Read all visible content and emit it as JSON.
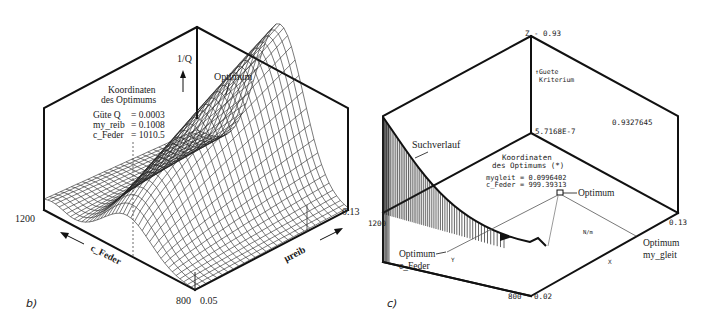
{
  "figure": {
    "panels": [
      {
        "id": "b",
        "label": "b)",
        "type": "3d-surface",
        "z_axis_label": "1/Q",
        "optimum_label": "Optimum",
        "info_box": {
          "title_line1": "Koordinaten",
          "title_line2": "des Optimums",
          "rows": [
            {
              "name": "Güte Q",
              "value": "= 0.0003"
            },
            {
              "name": "my_reib",
              "value": "= 0.1008"
            },
            {
              "name": "c_Feder",
              "value": "= 1010.5"
            }
          ]
        },
        "axes": {
          "x_label": "c_Feder",
          "y_label": "μreib",
          "x_tick_far": "1200",
          "x_tick_near": "800",
          "y_tick_near": "0.05",
          "y_tick_far": "0.13"
        }
      },
      {
        "id": "c",
        "label": "c)",
        "type": "3d-search-path",
        "z_top": "Z - 0.93",
        "z_axis_label_line1": "↑Guete",
        "z_axis_label_line2": "Kriterium",
        "z_min_value": "5.7168E-7",
        "z_right_value": "0.9327645",
        "path_label": "Suchverlauf",
        "info_box": {
          "title_line1": "Koordinaten",
          "title_line2": "des Optimums (*)",
          "rows": [
            {
              "name": "mygleit",
              "value": "= 0.0996402"
            },
            {
              "name": "c_Feder",
              "value": "= 999.39313"
            }
          ]
        },
        "optimum_marker_label": "Optimum",
        "optimum_c_feder_label_line1": "Optimum",
        "optimum_c_feder_label_line2": "c_Feder",
        "optimum_my_gleit_label_line1": "Optimum",
        "optimum_my_gleit_label_line2": "my_gleit",
        "axes": {
          "x_tick_far": "1200",
          "x_tick_near": "800",
          "y_tick_near": "0.02",
          "y_tick_far": "0.13",
          "y_letter": "Y",
          "x_letter": "X",
          "unit_label": "N/m"
        }
      }
    ]
  }
}
